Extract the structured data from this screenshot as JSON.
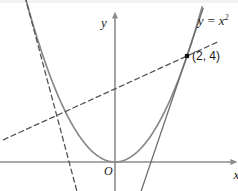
{
  "figure": {
    "type": "graph",
    "width": 238,
    "height": 191,
    "background_color": "#ffffff",
    "axis_color": "#8c8c8c",
    "curve_color": "#8a8a8a",
    "tangent_color": "#6e6e6e",
    "dashed_color": "#555555",
    "point_color": "#111111",
    "label_color": "#1a1a1a"
  },
  "labels": {
    "curve_equation": "y = x",
    "curve_exponent": "2",
    "point_label": "(2, 4)",
    "origin_label": "O",
    "x_axis_label": "x",
    "y_axis_label": "y"
  },
  "chart_data": {
    "type": "line",
    "title": "",
    "xlabel": "x",
    "ylabel": "y",
    "grid": false,
    "legend": "none",
    "origin_label": "O",
    "xlim": [
      -3.4,
      2.9
    ],
    "ylim": [
      -1.0,
      5.6
    ],
    "series": [
      {
        "name": "y = x^2",
        "kind": "parabola",
        "equation": "y = x^2",
        "style": "solid",
        "color": "#8a8a8a",
        "x_range": [
          -2.72,
          2.42
        ],
        "label": "y = x",
        "label_exponent": "2",
        "label_x": 2.3,
        "label_y": 5.35
      },
      {
        "name": "tangent at (2, 4)",
        "kind": "line",
        "equation": "y = 4x - 4",
        "slope": 4,
        "intercept": -4,
        "style": "solid",
        "color": "#6e6e6e",
        "x_range": [
          0.72,
          2.45
        ]
      },
      {
        "name": "secant through (2, 4)",
        "kind": "line",
        "equation": "y = 0.62x + 2.76",
        "slope": 0.62,
        "intercept": 2.76,
        "style": "dashed",
        "color": "#555555",
        "x_range": [
          -3.1,
          2.85
        ]
      },
      {
        "name": "tangent at left branch",
        "kind": "line",
        "equation": "y = -5.1x - 6.5",
        "slope": -5.1,
        "intercept": -6.5,
        "style": "dashed",
        "color": "#555555",
        "x_range": [
          -2.62,
          -1.05
        ]
      }
    ],
    "points": [
      {
        "name": "point-2-4",
        "x": 2,
        "y": 4,
        "label": "(2, 4)",
        "marker": "square-dot",
        "color": "#111111"
      }
    ]
  }
}
